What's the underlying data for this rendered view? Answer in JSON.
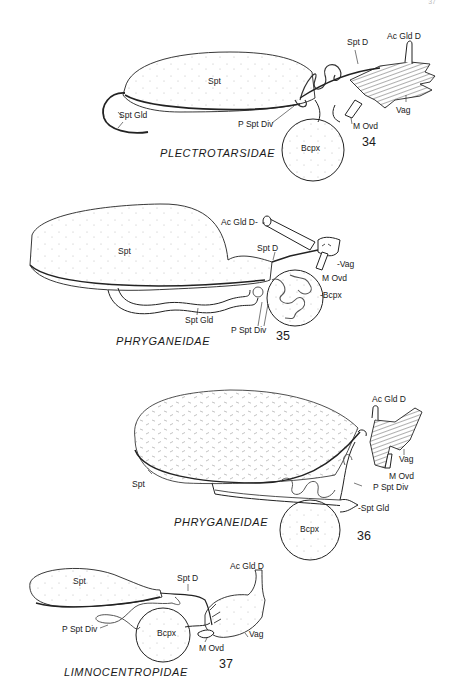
{
  "page": {
    "page_number": "37"
  },
  "figures": [
    {
      "number": "34",
      "family": "PLECTROTARSIDAE",
      "labels": {
        "spt": "Spt",
        "spt_gld": "Spt Gld",
        "spt_d": "Spt D",
        "ac_gld_d": "Ac Gld D",
        "vag": "Vag",
        "m_ovd": "M Ovd",
        "p_spt_div": "P Spt Div",
        "bcpx": "Bcpx"
      }
    },
    {
      "number": "35",
      "family": "PHRYGANEIDAE",
      "labels": {
        "spt": "Spt",
        "ac_gld_d": "Ac Gld D-",
        "spt_d": "Spt D",
        "vag": "-Vag",
        "m_ovd": "M Ovd",
        "bcpx": "-Bcpx",
        "spt_gld": "Spt Gld",
        "p_spt_div": "P Spt Div"
      }
    },
    {
      "number": "36",
      "family": "PHRYGANEIDAE",
      "labels": {
        "ac_gld_d": "Ac Gld D",
        "vag": "Vag",
        "m_ovd": "M Ovd",
        "spt": "Spt",
        "p_spt_div": "P Spt Div",
        "spt_gld": "-Spt Gld",
        "bcpx": "Bcpx"
      }
    },
    {
      "number": "37",
      "family": "LIMNOCENTROPIDAE",
      "labels": {
        "spt": "Spt",
        "spt_d": "Spt D",
        "ac_gld_d": "Ac Gld D",
        "p_spt_div": "P Spt Div",
        "bcpx": "Bcpx",
        "vag": "Vag",
        "m_ovd": "M Ovd"
      }
    }
  ]
}
